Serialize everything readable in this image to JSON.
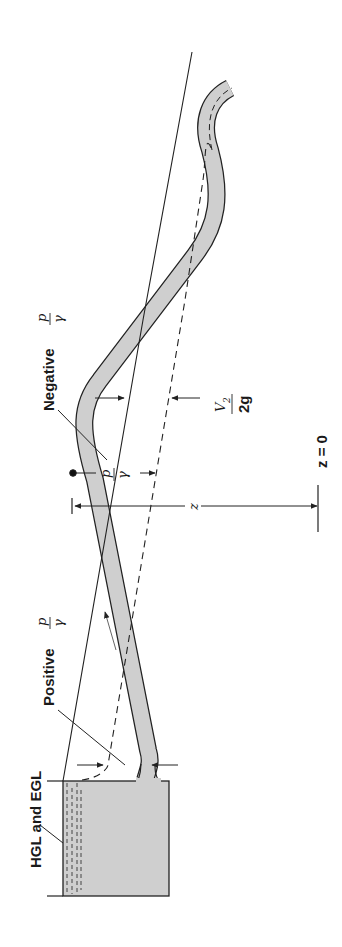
{
  "figure": {
    "orientation": "rotated 90 degrees counter-clockwise",
    "colors": {
      "water": "#cfcfcf",
      "line": "#222222",
      "background": "#ffffff"
    },
    "labels": {
      "hgl_egl": "HGL and EGL",
      "positive": "Positive",
      "negative": "Negative",
      "p": "p",
      "gamma": "γ",
      "z": "z",
      "v2": "V",
      "v2_sub": "2",
      "two_g": "2g",
      "z_equals_zero": "z = 0"
    }
  }
}
